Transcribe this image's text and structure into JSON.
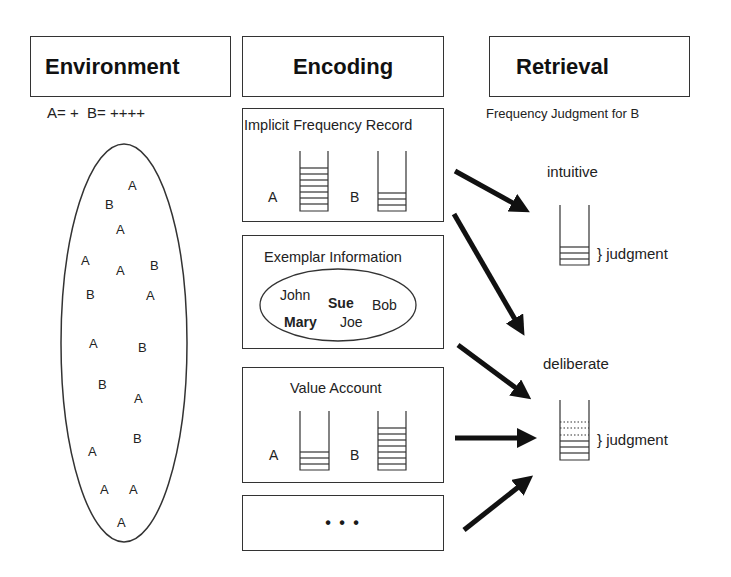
{
  "columns": {
    "environment": {
      "title": "Environment",
      "legend": "A= +  B= ++++"
    },
    "encoding": {
      "title": "Encoding"
    },
    "retrieval": {
      "title": "Retrieval",
      "subtitle": "Frequency Judgment for B"
    }
  },
  "environment_sample": {
    "letters": [
      "A",
      "B",
      "A",
      "A",
      "A",
      "B",
      "B",
      "A",
      "A",
      "B",
      "B",
      "A",
      "B",
      "A",
      "A",
      "A",
      "A"
    ]
  },
  "encoding_boxes": {
    "implicit": {
      "title": "Implicit Frequency Record",
      "label_a": "A",
      "label_b": "B",
      "stack_a_lines": 8,
      "stack_b_lines": 3
    },
    "exemplar": {
      "title": "Exemplar Information",
      "names": {
        "john": "John",
        "sue": "Sue",
        "bob": "Bob",
        "mary": "Mary",
        "joe": "Joe"
      }
    },
    "value": {
      "title": "Value Account",
      "label_a": "A",
      "label_b": "B",
      "stack_a_lines": 3,
      "stack_b_lines": 7
    },
    "more": {
      "title": "• • •"
    }
  },
  "retrieval_modes": {
    "intuitive": {
      "label": "intuitive",
      "judgment_label": "} judgment"
    },
    "deliberate": {
      "label": "deliberate",
      "judgment_label": "} judgment"
    }
  }
}
